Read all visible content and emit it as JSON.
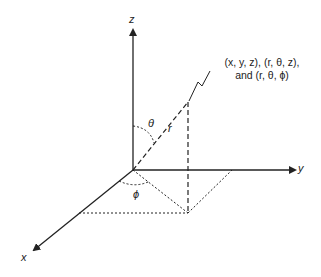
{
  "diagram": {
    "type": "3d-coordinate-system",
    "axes": {
      "z": "z",
      "y": "y",
      "x": "x"
    },
    "radius_label": "r",
    "polar_angle_label": "θ",
    "azimuth_angle_label": "ϕ",
    "annotation": {
      "line1": "(x, y, z), (r, θ, z),",
      "line2": "and (r, θ, ϕ)"
    },
    "colors": {
      "line": "#222222",
      "background": "#ffffff"
    }
  }
}
